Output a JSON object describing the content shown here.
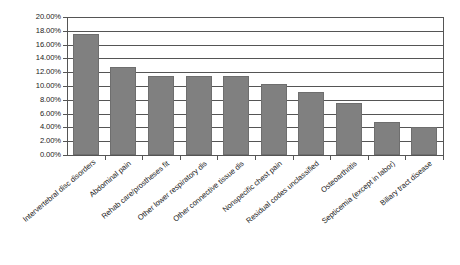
{
  "chart_data": {
    "type": "bar",
    "title": "",
    "xlabel": "",
    "ylabel": "",
    "categories": [
      "Intervertebral disc disorders",
      "Abdominal pain",
      "Rehab care/prostheses fit",
      "Other lower respiratory dis",
      "Other connective tissue dis",
      "Nonspecific chest pain",
      "Residual codes unclassified",
      "Osteoarthritis",
      "Septicemia (except in labor)",
      "Biliary tract disease"
    ],
    "values": [
      17.6,
      12.7,
      11.5,
      11.5,
      11.5,
      10.3,
      9.2,
      7.5,
      4.8,
      4.1
    ],
    "value_labels": [
      "17.60%",
      "12.70%",
      "11.50%",
      "11.50%",
      "11.50%",
      "10.30%",
      "9.20%",
      "7.50%",
      "4.80%",
      "4.10%"
    ],
    "ylim": [
      0,
      20
    ],
    "ytick_labels": [
      "20.00%",
      "18.00%",
      "16.00%",
      "14.00%",
      "12.00%",
      "10.00%",
      "8.00%",
      "6.00%",
      "4.00%",
      "2.00%",
      "0.00%"
    ],
    "ytick_values": [
      20,
      18,
      16,
      14,
      12,
      10,
      8,
      6,
      4,
      2,
      0
    ],
    "grid": true,
    "legend": "none",
    "bar_color": "#808080",
    "grid_color": "#555555",
    "background": "#ffffff"
  }
}
